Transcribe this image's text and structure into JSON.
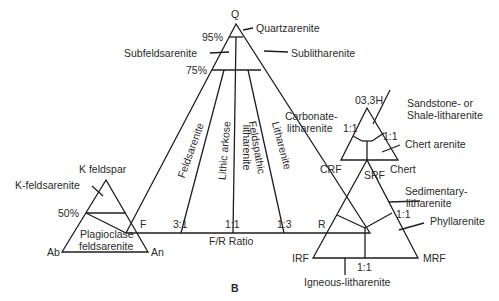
{
  "figure": {
    "panel_label": "B",
    "main_triangle": {
      "apex_q": "Q",
      "vertex_f": "F",
      "vertex_r": "R",
      "pct_95": "95%",
      "pct_75": "75%",
      "ratio_3_1": "3:1",
      "ratio_1_1": "1:1",
      "ratio_1_3": "1:3",
      "axis_label": "F/R Ratio",
      "fields": {
        "quartzarenite": "Quartzarenite",
        "subfeldsarenite": "Subfeldsarenite",
        "sublitharenite": "Sublitharenite",
        "feldsarenite": "Feldsarenite",
        "lithic_arkose": "Lithic arkose",
        "feldspathic_litharenite_1": "Feldspathic",
        "feldspathic_litharenite_2": "litharenite",
        "litharenite": "Litharenite"
      }
    },
    "feldspar_triangle": {
      "apex": "K feldspar",
      "left": "Ab",
      "right": "An",
      "pct_50": "50%",
      "k_feldsarenite": "K-feldsarenite",
      "plagioclase_1": "Plagioclase",
      "plagioclase_2": "feldsarenite"
    },
    "carbonate_triangle": {
      "apex": "03,3H",
      "left": "CRF",
      "right": "Chert",
      "ratio_left": "1:1",
      "ratio_right": "1:1",
      "carbonate_1": "Carbonate-",
      "carbonate_2": "litharenite",
      "sandstone_1": "Sandstone- or",
      "sandstone_2": "Shale-litharenite",
      "chert_arenite": "Chert arenite"
    },
    "rock_fragment_triangle": {
      "apex": "SRF",
      "left": "IRF",
      "right": "MRF",
      "ratio_right": "1:1",
      "ratio_bottom": "1:1",
      "sedimentary_1": "Sedimentary-",
      "sedimentary_2": "litharenite",
      "phyllarenite": "Phyllarenite",
      "igneous": "Igneous-litharenite"
    },
    "line_color": "#1e1e1e",
    "text_color": "#2a2a2a"
  }
}
